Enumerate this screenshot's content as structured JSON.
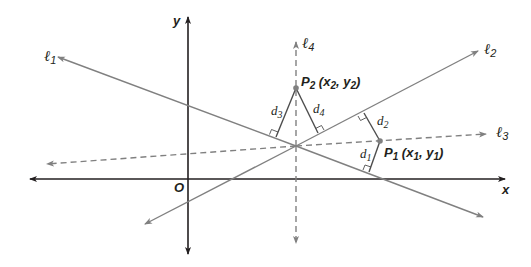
{
  "diagram": {
    "title": "",
    "colors": {
      "axis": "#231f20",
      "line": "#808080",
      "dashed_line": "#808080",
      "perpendicular": "#4d4d4d",
      "point": "#808080",
      "text": "#231f20"
    },
    "axes": {
      "x_label": "x",
      "y_label": "y",
      "origin_label": "O"
    },
    "lines": [
      {
        "id": "l1",
        "label": "ℓ",
        "subscript": "1",
        "style": "solid"
      },
      {
        "id": "l2",
        "label": "ℓ",
        "subscript": "2",
        "style": "solid"
      },
      {
        "id": "l3",
        "label": "ℓ",
        "subscript": "3",
        "style": "dashed"
      },
      {
        "id": "l4",
        "label": "ℓ",
        "subscript": "4",
        "style": "dashed"
      }
    ],
    "points": [
      {
        "id": "P1",
        "name": "P",
        "sub": "1",
        "coord_open": " (",
        "x": "x",
        "x_sub": "1",
        "sep": ", ",
        "y": "y",
        "y_sub": "1",
        "coord_close": ")"
      },
      {
        "id": "P2",
        "name": "P",
        "sub": "2",
        "coord_open": " (",
        "x": "x",
        "x_sub": "2",
        "sep": ", ",
        "y": "y",
        "y_sub": "2",
        "coord_close": ")"
      }
    ],
    "distances": [
      {
        "id": "d1",
        "label": "d",
        "sub": "1",
        "from": "P1",
        "to_line": "l1"
      },
      {
        "id": "d2",
        "label": "d",
        "sub": "2",
        "from": "P1",
        "to_line": "l2"
      },
      {
        "id": "d3",
        "label": "d",
        "sub": "3",
        "from": "P2",
        "to_line": "l1"
      },
      {
        "id": "d4",
        "label": "d",
        "sub": "4",
        "from": "P2",
        "to_line": "l2"
      }
    ]
  }
}
